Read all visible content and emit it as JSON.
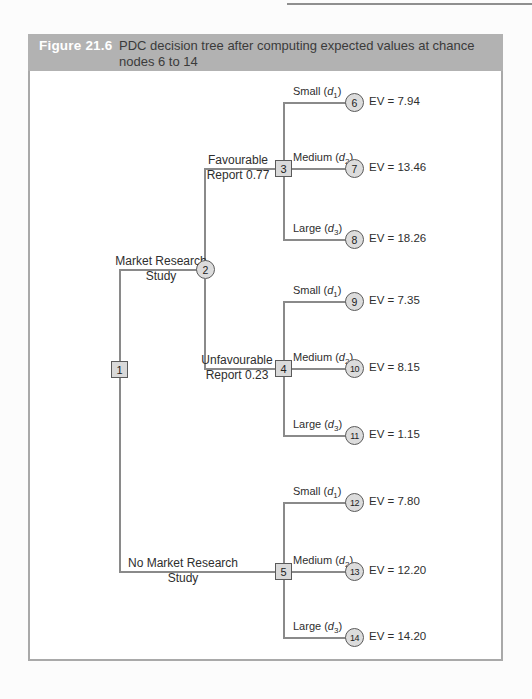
{
  "figure": {
    "label": "Figure 21.6",
    "title_lines": [
      "PDC decision tree after computing expected values at chance",
      "nodes 6 to 14"
    ]
  },
  "colors": {
    "header_band": "#b2b2b2",
    "figure_label_text": "#ffffff",
    "node_fill": "#d9d9d9",
    "node_border": "#5a5a5a",
    "branch_line": "#8a8a8a"
  },
  "tree": {
    "nodes": {
      "n1": "1",
      "n2": "2",
      "n3": "3",
      "n4": "4",
      "n5": "5"
    },
    "root_branches": [
      {
        "line1": "Market Research",
        "line2": "Study"
      },
      {
        "line1": "No Market Research",
        "line2": "Study"
      }
    ],
    "report_branches": [
      {
        "line1": "Favourable",
        "line2": "Report 0.77"
      },
      {
        "line1": "Unfavourable",
        "line2": "Report 0.23"
      }
    ],
    "outcomes": [
      {
        "prefix": "Small (",
        "var": "d",
        "sub": "1",
        "suffix": ")",
        "node": "6",
        "ev": "EV = 7.94"
      },
      {
        "prefix": "Medium (",
        "var": "d",
        "sub": "2",
        "suffix": ")",
        "node": "7",
        "ev": "EV = 13.46"
      },
      {
        "prefix": "Large (",
        "var": "d",
        "sub": "3",
        "suffix": ")",
        "node": "8",
        "ev": "EV = 18.26"
      },
      {
        "prefix": "Small (",
        "var": "d",
        "sub": "1",
        "suffix": ")",
        "node": "9",
        "ev": "EV = 7.35"
      },
      {
        "prefix": "Medium (",
        "var": "d",
        "sub": "2",
        "suffix": ")",
        "node": "10",
        "ev": "EV = 8.15"
      },
      {
        "prefix": "Large (",
        "var": "d",
        "sub": "3",
        "suffix": ")",
        "node": "11",
        "ev": "EV = 1.15"
      },
      {
        "prefix": "Small (",
        "var": "d",
        "sub": "1",
        "suffix": ")",
        "node": "12",
        "ev": "EV = 7.80"
      },
      {
        "prefix": "Medium (",
        "var": "d",
        "sub": "2",
        "suffix": ")",
        "node": "13",
        "ev": "EV = 12.20"
      },
      {
        "prefix": "Large (",
        "var": "d",
        "sub": "3",
        "suffix": ")",
        "node": "14",
        "ev": "EV = 14.20"
      }
    ]
  }
}
